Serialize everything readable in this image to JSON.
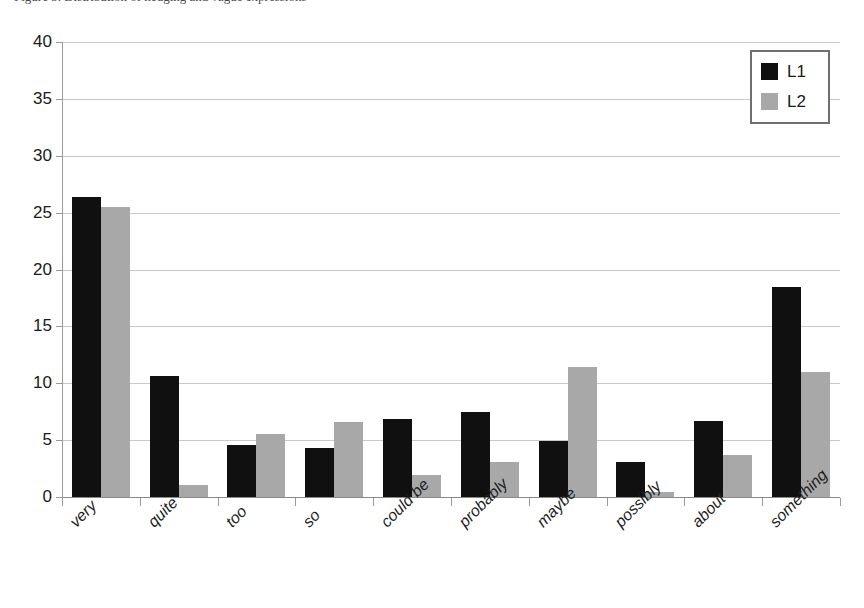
{
  "caption": {
    "text": "Figure 3. Distribution of hedging and vague expressions"
  },
  "chart_data": {
    "type": "bar",
    "title": "",
    "subtitle": "",
    "xlabel": "",
    "ylabel": "",
    "ylim": [
      0,
      40
    ],
    "ytick_step": 5,
    "ytick_labels": [
      "40",
      "35",
      "30",
      "25",
      "20",
      "15",
      "10",
      "5",
      "0"
    ],
    "ytick_values": [
      40,
      35,
      30,
      25,
      20,
      15,
      10,
      5,
      0
    ],
    "grid": true,
    "grid_axis": "y",
    "legend_position": "top-right",
    "categories": [
      "very",
      "quite",
      "too",
      "so",
      "could be",
      "probably",
      "maybe",
      "possibly",
      "about",
      "something"
    ],
    "series": [
      {
        "name": "L1",
        "color": "#101010",
        "values": [
          26.4,
          10.6,
          4.6,
          4.3,
          6.9,
          7.5,
          4.9,
          3.1,
          6.7,
          18.5
        ]
      },
      {
        "name": "L2",
        "color": "#a8a8a8",
        "values": [
          25.5,
          1.1,
          5.5,
          6.6,
          1.9,
          3.1,
          11.4,
          0.4,
          3.7,
          11.0
        ]
      }
    ]
  },
  "legend": {
    "entries": [
      {
        "label": "L1",
        "color": "#101010"
      },
      {
        "label": "L2",
        "color": "#a8a8a8"
      }
    ]
  },
  "colors": {
    "series_l1": "#101010",
    "series_l2": "#a8a8a8",
    "gridline": "#c9c9c9",
    "axis": "#9a9a9a",
    "background": "#ffffff",
    "text": "#1a1a1a"
  }
}
